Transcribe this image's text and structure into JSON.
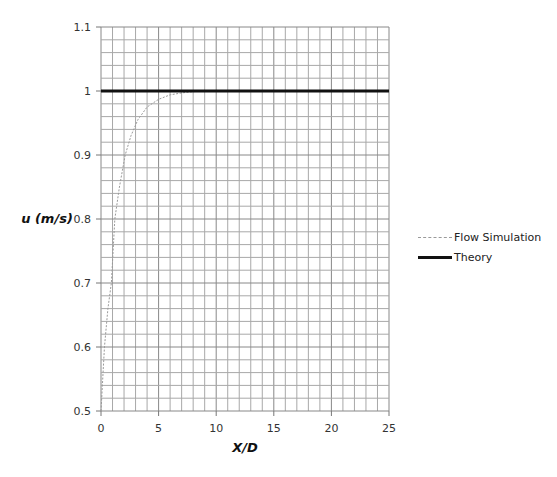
{
  "chart_data": {
    "type": "line",
    "title": "",
    "xlabel": "X/D",
    "ylabel": "u (m/s)",
    "xlim": [
      0,
      25
    ],
    "ylim": [
      0.5,
      1.1
    ],
    "x_ticks": [
      0,
      5,
      10,
      15,
      20,
      25
    ],
    "y_ticks": [
      0.5,
      0.6,
      0.7,
      0.8,
      0.9,
      1.0,
      1.1
    ],
    "x_tick_labels": [
      "0",
      "5",
      "10",
      "15",
      "20",
      "25"
    ],
    "y_tick_labels": [
      "0.5",
      "0.6",
      "0.7",
      "0.8",
      "0.9",
      "1",
      "1.1"
    ],
    "grid": true,
    "x_minor_step": 1,
    "y_minor_step": 0.02,
    "legend_position": "right",
    "series": [
      {
        "name": "Flow Simulation",
        "style": "dashed",
        "color": "#9a9a9a",
        "x": [
          0,
          0.3,
          0.6,
          0.9,
          1.2,
          1.6,
          2.1,
          2.6,
          3.2,
          4.0,
          5.0,
          6.0,
          7.0,
          8.0,
          9.0,
          10.0
        ],
        "y": [
          0.5,
          0.6,
          0.66,
          0.7,
          0.8,
          0.85,
          0.9,
          0.93,
          0.955,
          0.975,
          0.987,
          0.994,
          0.997,
          0.999,
          1.0,
          1.0
        ]
      },
      {
        "name": "Theory",
        "style": "solid-thick",
        "color": "#111111",
        "x": [
          0,
          25
        ],
        "y": [
          1.0,
          1.0
        ]
      }
    ]
  },
  "legend": {
    "items": [
      {
        "label": "Flow Simulation"
      },
      {
        "label": "Theory"
      }
    ]
  },
  "axes": {
    "xlabel": "X/D",
    "ylabel": "u (m/s)"
  }
}
